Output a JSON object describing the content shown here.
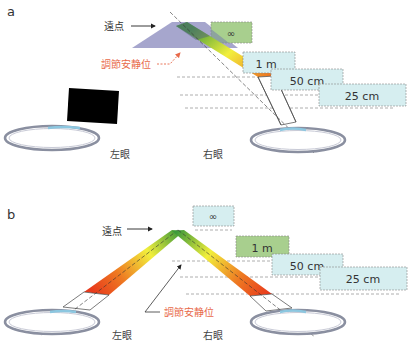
{
  "panels": [
    {
      "id": "a",
      "label": "a",
      "far_point_label": "遠点",
      "rest_accommodation_label": "調節安静位",
      "left_eye_label": "左眼",
      "right_eye_label": "右眼",
      "distance_boxes": [
        {
          "label": "∞",
          "color": "#a8cf8e"
        },
        {
          "label": "1 m",
          "color": "#d6eef0"
        },
        {
          "label": "50 cm",
          "color": "#d6eef0"
        },
        {
          "label": "25 cm",
          "color": "#d6eef0"
        }
      ]
    },
    {
      "id": "b",
      "label": "b",
      "far_point_label": "遠点",
      "rest_accommodation_label": "調節安静位",
      "left_eye_label": "左眼",
      "right_eye_label": "右眼",
      "distance_boxes": [
        {
          "label": "∞",
          "color": "#d6eef0"
        },
        {
          "label": "1 m",
          "color": "#a8cf8e"
        },
        {
          "label": "50 cm",
          "color": "#d6eef0"
        },
        {
          "label": "25 cm",
          "color": "#d6eef0"
        }
      ]
    }
  ],
  "colors": {
    "far_point_zone": "#9c9cc8",
    "highlight_box": "#a8cf8e",
    "distance_box": "#d6eef0",
    "rest_label": "#e8694a",
    "gradient_top": "#3e9a3a",
    "gradient_mid": "#f2ef3c",
    "gradient_bottom": "#e83a1c"
  }
}
